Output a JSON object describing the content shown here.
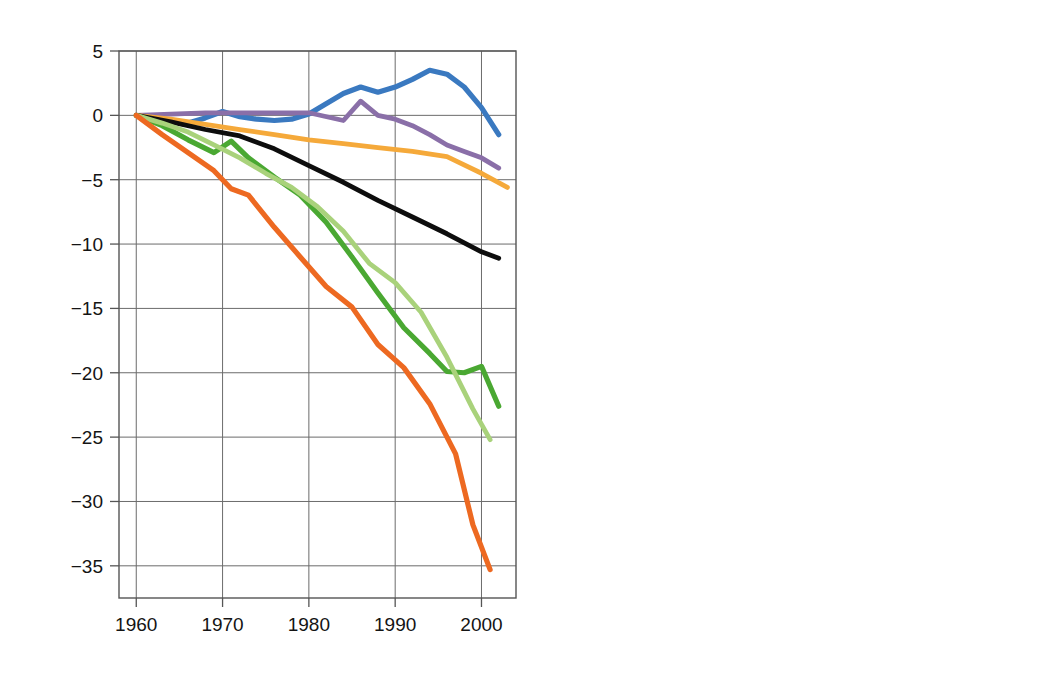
{
  "figure": {
    "panels": [
      {
        "id": "A",
        "letter": "A",
        "xlabel": "Ano",
        "ylabel_html": "Balanço de massa médio acumulado [10³kg m⁻²]",
        "ylabel_main": "Balanço de massa médio acumulado [10",
        "ylabel_sup1": "3",
        "ylabel_mid": "kg m",
        "ylabel_sup2": "-2",
        "ylabel_end": "]",
        "xticks": [
          "1960",
          "1970",
          "1980",
          "1990",
          "2000"
        ],
        "yticks": [
          "5",
          "0",
          "−5",
          "−10",
          "−15",
          "−20",
          "−25",
          "−30",
          "−35"
        ]
      },
      {
        "id": "B",
        "letter": "B",
        "xlabel": "Ano",
        "ylabel": "Balanço de massa total acumulado (mm N.M.M)",
        "xticks": [
          "1960",
          "1970",
          "1980",
          "1990",
          "2000"
        ],
        "yticks": [
          "−1",
          "0",
          "1",
          "2",
          "3",
          "4",
          "5",
          "6",
          "7"
        ]
      }
    ],
    "legend": {
      "position": "center-bottom-of-panel-B",
      "entries": [
        {
          "label": "Europa",
          "color": "#3a79c0",
          "swatch": "line-swatch"
        },
        {
          "label": "Andes",
          "color": "#8a6fa8",
          "swatch": "line-swatch"
        },
        {
          "label": "Ártico",
          "color": "#f5a93a",
          "swatch": "line-swatch"
        },
        {
          "label": "Montanhas elevadas da Ásia",
          "color": "#0d0d0d",
          "swatch": "line-swatch"
        },
        {
          "label": "NW EUA + SW Can",
          "color": "#4aa832",
          "swatch": "line-swatch"
        },
        {
          "label": "Alasca + montanhas costeiras",
          "color": "#a9d27b",
          "swatch": "line-swatch"
        },
        {
          "label": "Patagônia",
          "color": "#ed6921",
          "swatch": "line-swatch"
        }
      ]
    }
  },
  "chart_data": [
    {
      "type": "line",
      "panel": "A",
      "title": "A",
      "xlabel": "Ano",
      "ylabel": "Balanço de massa médio acumulado [10^3 kg m^-2]",
      "xlim": [
        1958,
        2004
      ],
      "ylim": [
        -37.5,
        5
      ],
      "xticks": [
        1960,
        1970,
        1980,
        1990,
        2000
      ],
      "yticks": [
        5,
        0,
        -5,
        -10,
        -15,
        -20,
        -25,
        -30,
        -35
      ],
      "grid": true,
      "legend": "panel B, center",
      "series": [
        {
          "name": "Europa",
          "color": "#3a79c0",
          "x": [
            1960,
            1962,
            1964,
            1966,
            1968,
            1970,
            1972,
            1974,
            1976,
            1978,
            1980,
            1982,
            1984,
            1986,
            1988,
            1990,
            1992,
            1994,
            1996,
            1998,
            2000,
            2002
          ],
          "y": [
            0.0,
            -0.2,
            -0.4,
            -0.6,
            -0.2,
            0.3,
            -0.1,
            -0.3,
            -0.4,
            -0.3,
            0.1,
            0.9,
            1.7,
            2.2,
            1.8,
            2.2,
            2.8,
            3.5,
            3.2,
            2.2,
            0.6,
            -1.5
          ]
        },
        {
          "name": "Andes",
          "color": "#8a6fa8",
          "x": [
            1960,
            1964,
            1968,
            1972,
            1976,
            1980,
            1984,
            1986,
            1988,
            1990,
            1992,
            1994,
            1996,
            1998,
            2000,
            2002
          ],
          "y": [
            0.0,
            0.1,
            0.2,
            0.2,
            0.2,
            0.2,
            -0.4,
            1.1,
            0.0,
            -0.3,
            -0.8,
            -1.5,
            -2.3,
            -2.8,
            -3.3,
            -4.1
          ]
        },
        {
          "name": "Ártico",
          "color": "#f5a93a",
          "x": [
            1960,
            1964,
            1968,
            1972,
            1976,
            1980,
            1984,
            1988,
            1992,
            1996,
            2000,
            2003
          ],
          "y": [
            0.0,
            -0.3,
            -0.7,
            -1.1,
            -1.5,
            -1.9,
            -2.2,
            -2.5,
            -2.8,
            -3.2,
            -4.5,
            -5.6
          ]
        },
        {
          "name": "Montanhas elevadas da Ásia",
          "color": "#0d0d0d",
          "x": [
            1960,
            1964,
            1968,
            1972,
            1976,
            1980,
            1984,
            1988,
            1992,
            1996,
            2000,
            2002
          ],
          "y": [
            0.0,
            -0.5,
            -1.1,
            -1.6,
            -2.6,
            -3.9,
            -5.2,
            -6.6,
            -7.9,
            -9.2,
            -10.6,
            -11.1
          ]
        },
        {
          "name": "NW EUA + SW Can",
          "color": "#4aa832",
          "x": [
            1960,
            1963,
            1966,
            1969,
            1971,
            1973,
            1976,
            1979,
            1982,
            1985,
            1988,
            1991,
            1994,
            1996,
            1998,
            2000,
            2002
          ],
          "y": [
            0.0,
            -0.8,
            -1.9,
            -2.9,
            -2.0,
            -3.3,
            -4.8,
            -6.2,
            -8.3,
            -11.0,
            -13.8,
            -16.5,
            -18.5,
            -19.9,
            -20.0,
            -19.5,
            -22.6
          ]
        },
        {
          "name": "Alasca + montanhas costeiras",
          "color": "#a9d27b",
          "x": [
            1960,
            1963,
            1966,
            1969,
            1972,
            1975,
            1978,
            1981,
            1984,
            1987,
            1990,
            1993,
            1996,
            1999,
            2001
          ],
          "y": [
            0.0,
            -0.6,
            -1.3,
            -2.3,
            -3.3,
            -4.5,
            -5.6,
            -7.1,
            -9.0,
            -11.5,
            -13.0,
            -15.3,
            -18.8,
            -22.8,
            -25.2
          ]
        },
        {
          "name": "Patagônia",
          "color": "#ed6921",
          "x": [
            1960,
            1963,
            1966,
            1969,
            1971,
            1973,
            1976,
            1979,
            1982,
            1985,
            1988,
            1991,
            1994,
            1997,
            1999,
            2001
          ],
          "y": [
            0.0,
            -1.5,
            -2.9,
            -4.3,
            -5.7,
            -6.2,
            -8.7,
            -11.0,
            -13.3,
            -14.9,
            -17.8,
            -19.6,
            -22.4,
            -26.3,
            -31.8,
            -35.3
          ]
        }
      ]
    },
    {
      "type": "line",
      "panel": "B",
      "title": "B",
      "xlabel": "Ano",
      "ylabel": "Balanço de massa total acumulado (mm N.M.M)",
      "xlim": [
        1958,
        2004
      ],
      "ylim_display_inverted": true,
      "ylim": [
        -1,
        7.6
      ],
      "xticks": [
        1960,
        1970,
        1980,
        1990,
        2000
      ],
      "yticks": [
        -1,
        0,
        1,
        2,
        3,
        4,
        5,
        6,
        7
      ],
      "grid": true,
      "series": [
        {
          "name": "Europa",
          "color": "#3a79c0",
          "x": [
            1960,
            1965,
            1970,
            1975,
            1980,
            1985,
            1988,
            1990,
            1992,
            1994,
            1996,
            1999,
            2002
          ],
          "y": [
            0.0,
            0.03,
            0.0,
            0.05,
            0.02,
            -0.06,
            -0.08,
            -0.12,
            -0.16,
            -0.12,
            -0.06,
            0.0,
            0.05
          ]
        },
        {
          "name": "Andes",
          "color": "#8a6fa8",
          "x": [
            1960,
            1970,
            1980,
            1990,
            1996,
            2002
          ],
          "y": [
            0.0,
            0.0,
            0.02,
            0.03,
            0.04,
            0.06
          ]
        },
        {
          "name": "Ártico",
          "color": "#f5a93a",
          "x": [
            1960,
            1962,
            1964,
            1966,
            1968,
            1971,
            1974,
            1977,
            1980,
            1983,
            1986,
            1989,
            1992,
            1995,
            1998,
            2000,
            2002
          ],
          "y": [
            0.0,
            0.9,
            0.35,
            0.8,
            1.25,
            1.6,
            1.75,
            2.05,
            2.2,
            2.4,
            2.65,
            2.9,
            3.2,
            3.5,
            3.9,
            4.55,
            4.9
          ]
        },
        {
          "name": "Montanhas elevadas da Ásia",
          "color": "#0d0d0d",
          "x": [
            1960,
            1964,
            1968,
            1972,
            1976,
            1980,
            1984,
            1988,
            1992,
            1996,
            2000,
            2002
          ],
          "y": [
            0.0,
            0.18,
            0.35,
            0.6,
            0.95,
            1.35,
            1.75,
            2.15,
            2.6,
            3.0,
            3.5,
            3.62
          ]
        },
        {
          "name": "NW EUA + SW Can",
          "color": "#4aa832",
          "x": [
            1960,
            1964,
            1968,
            1972,
            1976,
            1980,
            1984,
            1988,
            1991,
            1994,
            1997,
            2000,
            2002
          ],
          "y": [
            0.0,
            0.2,
            0.35,
            0.32,
            0.45,
            0.6,
            0.85,
            1.25,
            1.5,
            1.9,
            1.95,
            1.95,
            2.25
          ]
        },
        {
          "name": "Alasca + montanhas costeiras",
          "color": "#a9d27b",
          "x": [
            1960,
            1963,
            1966,
            1969,
            1972,
            1975,
            1978,
            1981,
            1984,
            1987,
            1990,
            1993,
            1996,
            1999,
            2001
          ],
          "y": [
            0.0,
            0.25,
            0.5,
            0.95,
            1.35,
            1.4,
            1.75,
            2.15,
            2.45,
            2.95,
            3.2,
            3.4,
            4.1,
            5.6,
            6.3
          ]
        },
        {
          "name": "Patagônia",
          "color": "#ed6921",
          "x": [
            1960,
            1965,
            1970,
            1974,
            1978,
            1982,
            1986,
            1989,
            1992,
            1995,
            1998,
            2001
          ],
          "y": [
            0.0,
            0.15,
            0.28,
            0.3,
            0.45,
            0.6,
            0.8,
            0.9,
            1.1,
            1.4,
            1.75,
            1.95
          ]
        }
      ]
    }
  ]
}
